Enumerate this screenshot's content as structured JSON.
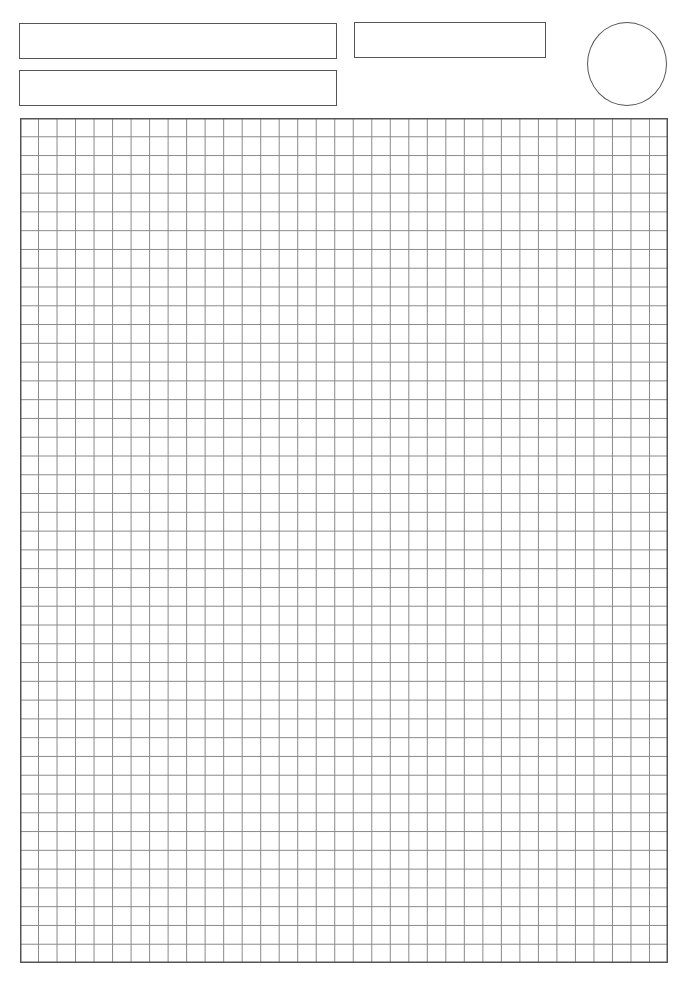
{
  "page": {
    "type": "grid-paper-template",
    "background": "#ffffff",
    "line_color": "#555555",
    "grid_line_color": "#8a8a8a"
  },
  "header": {
    "fields": [
      {
        "id": "field-1",
        "label": "",
        "value": ""
      },
      {
        "id": "field-2",
        "label": "",
        "value": ""
      },
      {
        "id": "field-3",
        "label": "",
        "value": ""
      }
    ],
    "circle": {
      "label": "",
      "value": ""
    }
  },
  "grid": {
    "columns": 35,
    "rows": 45
  }
}
